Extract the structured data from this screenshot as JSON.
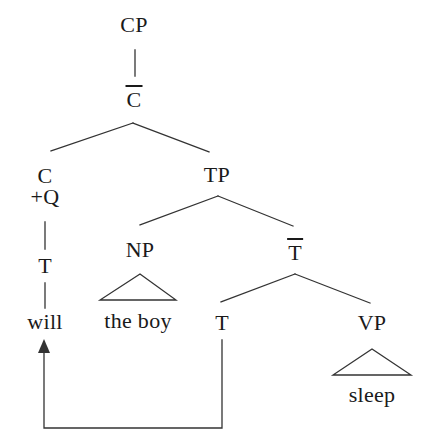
{
  "diagram": {
    "type": "syntax-tree",
    "theory": "x-bar",
    "sentence": "will the boy sleep",
    "background_color": "#ffffff",
    "line_color": "#333333",
    "text_color": "#1a1a1a"
  },
  "nodes": {
    "cp": {
      "label": "CP",
      "x": 134,
      "y": 24
    },
    "cbar": {
      "label": "C",
      "overbar": true,
      "x": 134,
      "y": 99
    },
    "c_head": {
      "label": "C",
      "x": 45,
      "y": 176
    },
    "c_feature": {
      "label": "+Q",
      "x": 42,
      "y": 197
    },
    "t_moved": {
      "label": "T",
      "x": 45,
      "y": 266
    },
    "will": {
      "label": "will",
      "x": 45,
      "y": 322
    },
    "tp": {
      "label": "TP",
      "x": 217,
      "y": 175
    },
    "np": {
      "label": "NP",
      "x": 140,
      "y": 250
    },
    "the_boy": {
      "label": "the boy",
      "x": 138,
      "y": 321
    },
    "tbar": {
      "label": "T",
      "overbar": true,
      "x": 295,
      "y": 252
    },
    "t_trace": {
      "label": "T",
      "x": 222,
      "y": 323
    },
    "vp": {
      "label": "VP",
      "x": 372,
      "y": 323
    },
    "sleep": {
      "label": "sleep",
      "x": 372,
      "y": 395
    }
  },
  "edges": [
    {
      "name": "cp-to-cbar",
      "from": "cp",
      "to": "cbar",
      "style": "vertical"
    },
    {
      "name": "cbar-to-c",
      "from": "cbar",
      "to": "c_head",
      "style": "branch"
    },
    {
      "name": "cbar-to-tp",
      "from": "cbar",
      "to": "tp",
      "style": "branch"
    },
    {
      "name": "c-to-t",
      "from": "c_feature",
      "to": "t_moved",
      "style": "vertical"
    },
    {
      "name": "t-to-will",
      "from": "t_moved",
      "to": "will",
      "style": "vertical"
    },
    {
      "name": "tp-to-np",
      "from": "tp",
      "to": "np",
      "style": "branch"
    },
    {
      "name": "tp-to-tbar",
      "from": "tp",
      "to": "tbar",
      "style": "branch"
    },
    {
      "name": "tbar-to-t",
      "from": "tbar",
      "to": "t_trace",
      "style": "branch"
    },
    {
      "name": "tbar-to-vp",
      "from": "tbar",
      "to": "vp",
      "style": "branch"
    }
  ],
  "triangles": [
    {
      "name": "np-triangle",
      "node": "np",
      "terminal": "the boy"
    },
    {
      "name": "vp-triangle",
      "node": "vp",
      "terminal": "sleep"
    }
  ],
  "movement": {
    "name": "head-movement-arrow",
    "from": "t_trace",
    "to": "will",
    "description": "T raises to C"
  }
}
